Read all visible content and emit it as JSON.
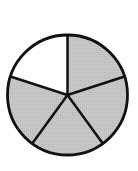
{
  "figure": {
    "total_parts": 5,
    "shaded_parts": 4,
    "unshaded_parts": 1,
    "center": [
      67.5,
      95
    ],
    "radius": 60,
    "start_angle_deg": -90,
    "stroke_color": "#111111",
    "stroke_width": 2.5,
    "shaded_color": "#c4c4c4",
    "unshaded_color": "#ffffff",
    "sectors": [
      {
        "index": 0,
        "from_deg": -90,
        "to_deg": -18,
        "shaded": true
      },
      {
        "index": 1,
        "from_deg": -18,
        "to_deg": 54,
        "shaded": true
      },
      {
        "index": 2,
        "from_deg": 54,
        "to_deg": 126,
        "shaded": true
      },
      {
        "index": 3,
        "from_deg": 126,
        "to_deg": 198,
        "shaded": true
      },
      {
        "index": 4,
        "from_deg": 198,
        "to_deg": 270,
        "shaded": false
      }
    ]
  },
  "chart_data": {
    "type": "pie",
    "title": "",
    "categories": [
      "Part 1",
      "Part 2",
      "Part 3",
      "Part 4",
      "Part 5"
    ],
    "values": [
      1,
      1,
      1,
      1,
      1
    ],
    "shaded": [
      true,
      true,
      true,
      true,
      false
    ],
    "fraction_shaded": "4/5",
    "legend": "none"
  }
}
